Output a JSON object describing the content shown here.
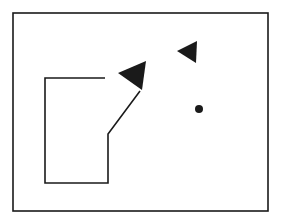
{
  "diagram": {
    "background": "#ffffff",
    "stroke_color": "#1a1a1a",
    "frame": {
      "x": 13,
      "y": 13,
      "width": 255,
      "height": 198
    },
    "path": {
      "points": [
        [
          105,
          78
        ],
        [
          45,
          78
        ],
        [
          45,
          183
        ],
        [
          108,
          183
        ],
        [
          108,
          134
        ],
        [
          140,
          91
        ]
      ]
    },
    "markers": [
      {
        "name": "large-triangle",
        "points": [
          [
            118,
            73
          ],
          [
            146,
            61
          ],
          [
            142,
            90
          ]
        ]
      },
      {
        "name": "small-triangle",
        "points": [
          [
            177,
            51
          ],
          [
            197,
            41
          ],
          [
            196,
            63
          ]
        ]
      }
    ],
    "dot": {
      "cx": 199,
      "cy": 109,
      "r": 4
    }
  }
}
